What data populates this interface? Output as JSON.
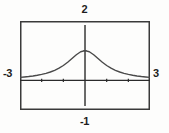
{
  "widget": {
    "name": "graphing-calculator-plot",
    "frame_color": "#3a3a3a",
    "axis_color": "#2b2b2b",
    "curve_color": "#4a4a4a",
    "background_color": "#fdfdfc",
    "label_color": "#1d1d1d"
  },
  "labels": {
    "top": "2",
    "bottom": "-1",
    "left": "-3",
    "right": "3"
  },
  "chart_data": {
    "type": "line",
    "title": "",
    "subtitle": "",
    "xlabel": "",
    "ylabel": "",
    "xlim": [
      -3,
      2.999
    ],
    "ylim": [
      -1,
      2
    ],
    "grid": false,
    "legend": null,
    "annotations": [],
    "window_labels": {
      "xmin": "-3",
      "xmax": "3",
      "ymin": "-1",
      "ymax": "2"
    },
    "xticks": [
      -3,
      -2,
      -1,
      0,
      1,
      2,
      3
    ],
    "yticks": [
      -1,
      0,
      1,
      2
    ],
    "xtick_labels": [
      "",
      "",
      "",
      "",
      "",
      "",
      ""
    ],
    "ytick_labels": [
      "",
      "",
      "",
      ""
    ],
    "series": [
      {
        "name": "y = 1/(x^2+1)",
        "x": [
          -3,
          -2.8,
          -2.6,
          -2.4,
          -2.2,
          -2,
          -1.8,
          -1.6,
          -1.4,
          -1.2,
          -1,
          -0.8,
          -0.6,
          -0.4,
          -0.2,
          0,
          0.2,
          0.4,
          0.6,
          0.8,
          1,
          1.2,
          1.4,
          1.6,
          1.8,
          2,
          2.2,
          2.4,
          2.6,
          2.8,
          3
        ],
        "y": [
          0.1,
          0.113,
          0.129,
          0.148,
          0.171,
          0.2,
          0.236,
          0.281,
          0.338,
          0.41,
          0.5,
          0.61,
          0.735,
          0.862,
          0.962,
          1,
          0.962,
          0.862,
          0.735,
          0.61,
          0.5,
          0.41,
          0.338,
          0.281,
          0.236,
          0.2,
          0.171,
          0.148,
          0.129,
          0.113,
          0.1
        ]
      }
    ]
  }
}
